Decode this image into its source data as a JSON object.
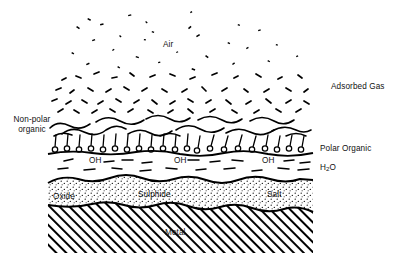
{
  "diagram": {
    "type": "layered-cross-section",
    "body": {
      "x": 48,
      "y": 0,
      "width": 265,
      "height": 253
    },
    "colors": {
      "ink": "#000000",
      "background": "#ffffff"
    },
    "labels": {
      "air": "Air",
      "adsorbed_gas": "Adsorbed Gas",
      "non_polar_organic_line1": "Non-polar",
      "non_polar_organic_line2": "organic",
      "polar_organic": "Polar Organic",
      "water": "H",
      "water_sub": "2",
      "water_tail": "O",
      "oxide": "Oxide",
      "sulphide": "Sulphide",
      "salt": "Salt",
      "metal": "Metal",
      "hydroxyl": "OH"
    },
    "label_positions": {
      "air": {
        "x": 165,
        "y": 44
      },
      "adsorbed_gas": {
        "x": 331,
        "y": 82
      },
      "non_polar_organic": {
        "x": 6,
        "y": 119
      },
      "polar_organic": {
        "x": 320,
        "y": 146
      },
      "water": {
        "x": 320,
        "y": 164
      },
      "oxide": {
        "x": 53,
        "y": 194
      },
      "sulphide": {
        "x": 160,
        "y": 192
      },
      "salt": {
        "x": 272,
        "y": 192
      },
      "metal": {
        "x": 172,
        "y": 231
      }
    },
    "hydroxyl_positions": [
      {
        "x": 82,
        "y": 160
      },
      {
        "x": 168,
        "y": 160
      },
      {
        "x": 258,
        "y": 160
      }
    ],
    "layers": [
      {
        "name": "air",
        "label": "Air",
        "fill": "specks",
        "top": 0,
        "bottom": 112
      },
      {
        "name": "adsorbed-gas",
        "label": "Adsorbed Gas",
        "fill": "dashes",
        "top": 60,
        "bottom": 115
      },
      {
        "name": "non-polar-organic",
        "label": "Non-polar organic",
        "fill": "squiggles",
        "top": 112,
        "bottom": 140
      },
      {
        "name": "polar-organic",
        "label": "Polar Organic",
        "fill": "surfactant-heads",
        "top": 136,
        "bottom": 156
      },
      {
        "name": "water",
        "label": "H2O",
        "fill": "dashes-oh",
        "top": 152,
        "bottom": 178
      },
      {
        "name": "oxide-sulphide-salt",
        "label": "Oxide / Sulphide / Salt",
        "fill": "stipple",
        "top": 176,
        "bottom": 210
      },
      {
        "name": "metal",
        "label": "Metal",
        "fill": "diagonal-hatch",
        "top": 206,
        "bottom": 253
      }
    ],
    "surfactant": {
      "head_shape": "circle",
      "head_radius": 2.6,
      "count": 21
    }
  }
}
